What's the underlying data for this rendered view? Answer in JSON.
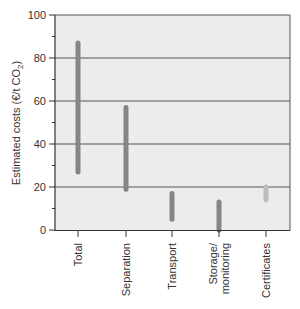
{
  "chart_data": {
    "type": "range-bar",
    "title": "",
    "xlabel": "",
    "ylabel": "Estimated costs (€/t CO₂)",
    "ylim": [
      0,
      100
    ],
    "yticks": [
      0,
      20,
      40,
      60,
      80,
      100
    ],
    "grid": true,
    "categories": [
      "Total",
      "Separation",
      "Transport",
      "Storage/\nmonitoring",
      "Certificates"
    ],
    "ranges": [
      {
        "category": "Total",
        "low": 27,
        "high": 87
      },
      {
        "category": "Separation",
        "low": 19,
        "high": 57
      },
      {
        "category": "Transport",
        "low": 5,
        "high": 17
      },
      {
        "category": "Storage/ monitoring",
        "low": 0,
        "high": 13
      },
      {
        "category": "Certificates",
        "low": 14,
        "high": 20
      }
    ],
    "colors": {
      "plot_background": "#ececec",
      "bar": "#858585",
      "bar_light": "#bdbdbd",
      "gridline": "#555555"
    }
  },
  "ylabel_text": "Estimated costs (€/t CO",
  "ylabel_sub": "2",
  "ylabel_close": ")"
}
